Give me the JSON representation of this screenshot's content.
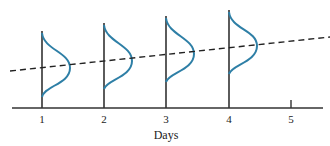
{
  "diagram": {
    "type": "distribution-over-time",
    "xlabel": "Days",
    "ticks": [
      "1",
      "2",
      "3",
      "4",
      "5"
    ],
    "distributions": [
      {
        "day": "1",
        "mean_level": 0
      },
      {
        "day": "2",
        "mean_level": 1
      },
      {
        "day": "3",
        "mean_level": 2
      },
      {
        "day": "4",
        "mean_level": 3
      }
    ],
    "trend_line": {
      "style": "dashed",
      "direction": "increasing"
    },
    "colors": {
      "curve": "#2e7fa6",
      "axis": "#222222",
      "trend": "#222222"
    }
  }
}
